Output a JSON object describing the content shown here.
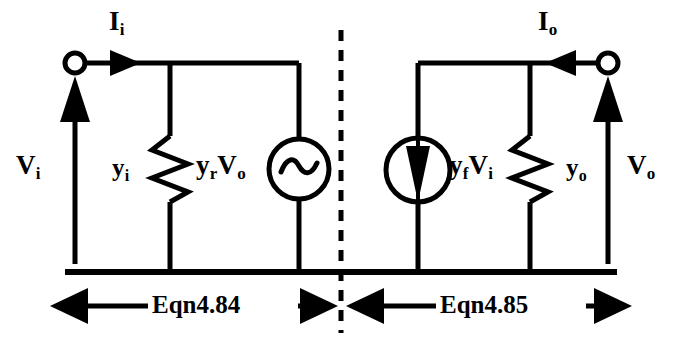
{
  "figure": {
    "type": "two-port-y-parameter-equivalent-circuit",
    "background_color": "#ffffff",
    "ink_color": "#000000",
    "width": 682,
    "height": 350
  },
  "labels": {
    "current_in": {
      "main": "I",
      "sub": "i"
    },
    "current_out": {
      "main": "I",
      "sub": "o"
    },
    "voltage_in": {
      "main": "V",
      "sub": "i"
    },
    "voltage_out": {
      "main": "V",
      "sub": "o"
    },
    "admittance_in": {
      "main": "y",
      "sub": "i"
    },
    "admittance_out": {
      "main": "y",
      "sub": "o"
    },
    "reverse_source": {
      "coef_main": "y",
      "coef_sub": "r",
      "var_main": "V",
      "var_sub": "o"
    },
    "forward_source": {
      "coef_main": "y",
      "coef_sub": "f",
      "var_main": "V",
      "var_sub": "i"
    }
  },
  "annotations": {
    "left_span": "Eqn4.84",
    "right_span": "Eqn4.85"
  },
  "components": {
    "input_terminal": "open-circle-terminal",
    "output_terminal": "open-circle-terminal",
    "input_admittance": "resistor-zigzag",
    "output_admittance": "resistor-zigzag",
    "reverse_voltage_source": "ac-sine-source",
    "forward_current_source": "current-source-down-arrow",
    "divider": "dashed-vertical-line",
    "ground_rail": "horizontal-rail"
  }
}
